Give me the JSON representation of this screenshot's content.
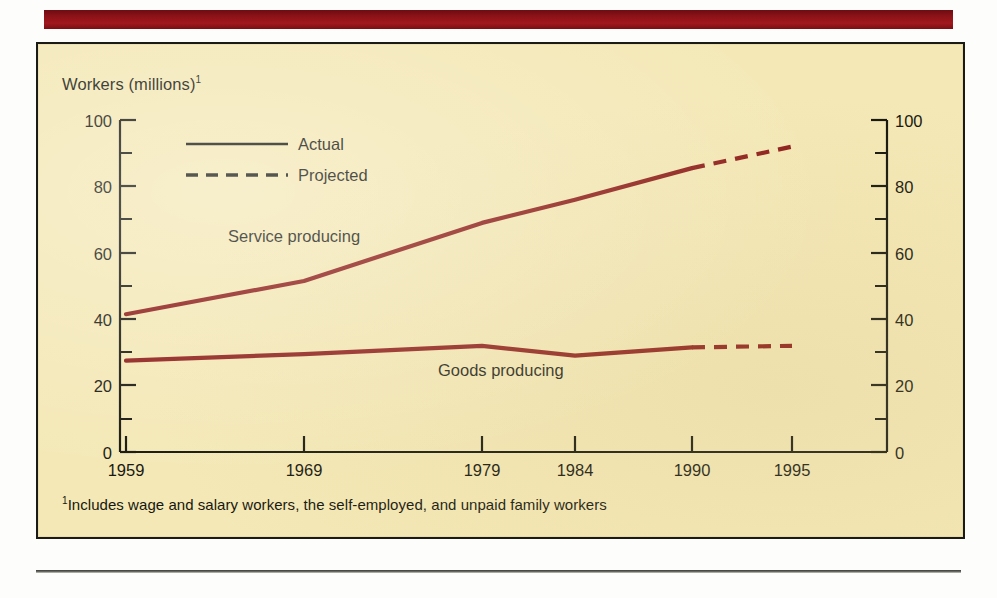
{
  "banner": {
    "color": "#8d1318"
  },
  "panel": {
    "background": "#f4e8b6",
    "border_color": "#1a1a16"
  },
  "chart_data": {
    "type": "line",
    "title": "Workers (millions)",
    "title_superscript": "1",
    "xlabel": "",
    "ylabel": "Workers (millions)",
    "ylim": [
      0,
      100
    ],
    "y_ticks_major": [
      0,
      20,
      40,
      60,
      80,
      100
    ],
    "y_ticks_minor": [
      10,
      30,
      50,
      70,
      90
    ],
    "grid": false,
    "legend_position": "top-left-inside",
    "legend": [
      {
        "label": "Actual",
        "style": "solid"
      },
      {
        "label": "Projected",
        "style": "dashed"
      }
    ],
    "x_tick_labels": [
      "1959",
      "1969",
      "1979",
      "1984",
      "1990",
      "1995"
    ],
    "x": [
      1959,
      1969,
      1979,
      1984,
      1990,
      1995
    ],
    "projection_starts_at": 1990,
    "line_color": "#8c1a16",
    "series": [
      {
        "name": "Service producing",
        "values": [
          41.5,
          51.5,
          69.0,
          76.0,
          85.5,
          92.0
        ],
        "annotation": "Service producing"
      },
      {
        "name": "Goods producing",
        "values": [
          27.5,
          29.5,
          32.0,
          29.0,
          31.5,
          32.0
        ],
        "annotation": "Goods producing"
      }
    ],
    "axis_labels_left": [
      "100",
      "80",
      "60",
      "40",
      "20",
      "0"
    ],
    "axis_labels_right": [
      "100",
      "80",
      "60",
      "40",
      "20",
      "0"
    ]
  },
  "footnote": {
    "marker": "1",
    "text": "Includes wage and salary workers, the self-employed, and unpaid family workers"
  },
  "annotations": {
    "service_label": "Service producing",
    "goods_label": "Goods producing"
  }
}
